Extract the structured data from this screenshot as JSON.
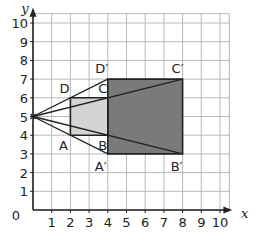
{
  "diagram": {
    "type": "enlargement-on-coordinate-grid",
    "axes": {
      "x_label": "x",
      "y_label": "y",
      "origin_label": "0",
      "x_ticks": [
        "1",
        "2",
        "3",
        "4",
        "5",
        "6",
        "7",
        "8",
        "9",
        "10"
      ],
      "y_ticks": [
        "1",
        "2",
        "3",
        "4",
        "5",
        "6",
        "7",
        "8",
        "9",
        "10"
      ],
      "range": {
        "x": [
          0,
          10.5
        ],
        "y": [
          0,
          10.5
        ]
      },
      "grid": true
    },
    "centre_of_enlargement": {
      "x": 0,
      "y": 5
    },
    "original_shape": {
      "name": "ABCD",
      "fill": "#d4d4d4",
      "vertices": [
        {
          "label": "A",
          "x": 2,
          "y": 4
        },
        {
          "label": "B",
          "x": 4,
          "y": 4
        },
        {
          "label": "C",
          "x": 4,
          "y": 6
        },
        {
          "label": "D",
          "x": 2,
          "y": 6
        }
      ]
    },
    "image_shape": {
      "name": "A'B'C'D'",
      "fill": "#7a7a7a",
      "vertices": [
        {
          "label": "A′",
          "x": 4,
          "y": 3
        },
        {
          "label": "B′",
          "x": 8,
          "y": 3
        },
        {
          "label": "C′",
          "x": 8,
          "y": 7
        },
        {
          "label": "D′",
          "x": 4,
          "y": 7
        }
      ]
    },
    "rays": [
      {
        "from": "centre",
        "to": "D′"
      },
      {
        "from": "centre",
        "to": "C′"
      },
      {
        "from": "centre",
        "to": "B′"
      },
      {
        "from": "centre",
        "to": "A′"
      }
    ],
    "colors": {
      "grid": "#b8b8b8",
      "axis": "#222222",
      "lines": "#222222"
    }
  }
}
